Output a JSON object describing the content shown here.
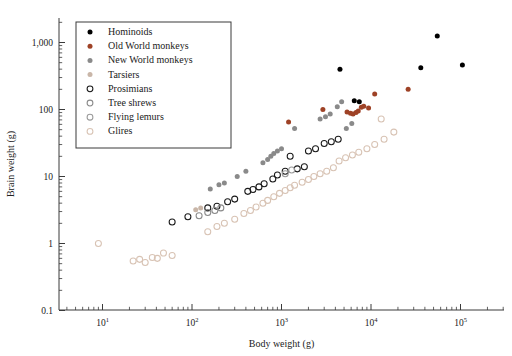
{
  "axes": {
    "xlabel": "Body weight (g)",
    "ylabel": "Brain weight (g)",
    "xticks": [
      "10",
      "10",
      "10",
      "10",
      "10"
    ],
    "xtick_exponents": [
      "1",
      "2",
      "3",
      "4",
      "5"
    ],
    "yticks": [
      "1,000",
      "100",
      "10",
      "1",
      "0.1"
    ]
  },
  "legend": {
    "items": [
      {
        "label": "Hominoids",
        "color": "#000000",
        "filled": true,
        "marker": "filled-circle-black"
      },
      {
        "label": "Old World monkeys",
        "color": "#9e4226",
        "filled": true,
        "marker": "filled-circle-red"
      },
      {
        "label": "New World monkeys",
        "color": "#8a8a8a",
        "filled": true,
        "marker": "filled-circle-gray"
      },
      {
        "label": "Tarsiers",
        "color": "#c9b6a8",
        "filled": true,
        "marker": "filled-circle-tan"
      },
      {
        "label": "Prosimians",
        "color": "#1a1a1a",
        "filled": false,
        "marker": "open-circle-black"
      },
      {
        "label": "Tree shrews",
        "color": "#8a8a8a",
        "filled": false,
        "marker": "open-circle-gray"
      },
      {
        "label": "Flying lemurs",
        "color": "#9a9a9a",
        "filled": false,
        "marker": "open-circle-gray2"
      },
      {
        "label": "Glires",
        "color": "#d8c3b4",
        "filled": false,
        "marker": "open-circle-light"
      }
    ]
  },
  "chart_data": {
    "type": "scatter",
    "title": "",
    "xlabel": "Body weight (g)",
    "ylabel": "Brain weight (g)",
    "xscale": "log",
    "yscale": "log",
    "xlim": [
      3.2,
      320000
    ],
    "ylim": [
      0.1,
      3000
    ],
    "grid": false,
    "legend_position": "upper-left",
    "series": [
      {
        "name": "Hominoids",
        "color": "#000000",
        "filled": true,
        "points": [
          [
            4500,
            400
          ],
          [
            6500,
            135
          ],
          [
            7400,
            130
          ],
          [
            36000,
            420
          ],
          [
            55000,
            1250
          ],
          [
            105000,
            460
          ]
        ]
      },
      {
        "name": "Old World monkeys",
        "color": "#9e4226",
        "filled": true,
        "points": [
          [
            1200,
            65
          ],
          [
            2900,
            100
          ],
          [
            5400,
            92
          ],
          [
            5900,
            88
          ],
          [
            6300,
            86
          ],
          [
            6800,
            90
          ],
          [
            7200,
            95
          ],
          [
            7800,
            108
          ],
          [
            8300,
            112
          ],
          [
            9400,
            105
          ],
          [
            11000,
            170
          ],
          [
            26000,
            200
          ]
        ]
      },
      {
        "name": "New World monkeys",
        "color": "#8a8a8a",
        "filled": true,
        "points": [
          [
            160,
            6.5
          ],
          [
            200,
            7.5
          ],
          [
            230,
            8.0
          ],
          [
            320,
            10
          ],
          [
            400,
            12
          ],
          [
            620,
            16
          ],
          [
            700,
            18
          ],
          [
            760,
            20
          ],
          [
            820,
            22
          ],
          [
            900,
            24
          ],
          [
            1000,
            26
          ],
          [
            1400,
            52
          ],
          [
            2700,
            72
          ],
          [
            3100,
            78
          ],
          [
            3500,
            86
          ],
          [
            4200,
            110
          ],
          [
            4700,
            130
          ],
          [
            5300,
            52
          ],
          [
            6100,
            62
          ]
        ]
      },
      {
        "name": "Tarsiers",
        "color": "#c9b6a8",
        "filled": true,
        "points": [
          [
            110,
            3.2
          ],
          [
            125,
            3.4
          ]
        ]
      },
      {
        "name": "Prosimians",
        "color": "#1a1a1a",
        "filled": false,
        "points": [
          [
            60,
            2.1
          ],
          [
            90,
            2.5
          ],
          [
            150,
            3.4
          ],
          [
            190,
            3.6
          ],
          [
            250,
            4.2
          ],
          [
            300,
            4.6
          ],
          [
            420,
            6.0
          ],
          [
            480,
            6.4
          ],
          [
            560,
            7.0
          ],
          [
            640,
            7.8
          ],
          [
            800,
            9.2
          ],
          [
            900,
            10.5
          ],
          [
            1100,
            12
          ],
          [
            1250,
            20
          ],
          [
            1500,
            13
          ],
          [
            1800,
            14
          ],
          [
            2000,
            24
          ],
          [
            2400,
            26
          ],
          [
            3000,
            31
          ],
          [
            3600,
            33
          ],
          [
            4300,
            36
          ]
        ]
      },
      {
        "name": "Tree shrews",
        "color": "#8a8a8a",
        "filled": false,
        "points": [
          [
            120,
            2.6
          ],
          [
            150,
            2.9
          ],
          [
            180,
            3.1
          ],
          [
            210,
            3.4
          ]
        ]
      },
      {
        "name": "Flying lemurs",
        "color": "#9a9a9a",
        "filled": false,
        "points": [
          [
            1100,
            11
          ],
          [
            1300,
            12.5
          ]
        ]
      },
      {
        "name": "Glires",
        "color": "#d8c3b4",
        "filled": false,
        "points": [
          [
            9,
            1.0
          ],
          [
            22,
            0.55
          ],
          [
            26,
            0.58
          ],
          [
            30,
            0.52
          ],
          [
            36,
            0.62
          ],
          [
            41,
            0.6
          ],
          [
            48,
            0.72
          ],
          [
            60,
            0.66
          ],
          [
            150,
            1.5
          ],
          [
            190,
            1.8
          ],
          [
            230,
            2.0
          ],
          [
            300,
            2.3
          ],
          [
            380,
            2.8
          ],
          [
            450,
            3.1
          ],
          [
            520,
            3.5
          ],
          [
            620,
            4.0
          ],
          [
            700,
            4.4
          ],
          [
            820,
            5.0
          ],
          [
            950,
            5.6
          ],
          [
            1100,
            6.2
          ],
          [
            1250,
            6.8
          ],
          [
            1400,
            7.4
          ],
          [
            1700,
            8.2
          ],
          [
            2000,
            9.0
          ],
          [
            2300,
            10
          ],
          [
            2700,
            11
          ],
          [
            3200,
            12
          ],
          [
            3800,
            13.5
          ],
          [
            4400,
            17
          ],
          [
            5200,
            19
          ],
          [
            6200,
            21
          ],
          [
            7300,
            23
          ],
          [
            9000,
            26
          ],
          [
            11000,
            30
          ],
          [
            14000,
            36
          ],
          [
            18000,
            46
          ],
          [
            13000,
            72
          ]
        ]
      }
    ]
  }
}
